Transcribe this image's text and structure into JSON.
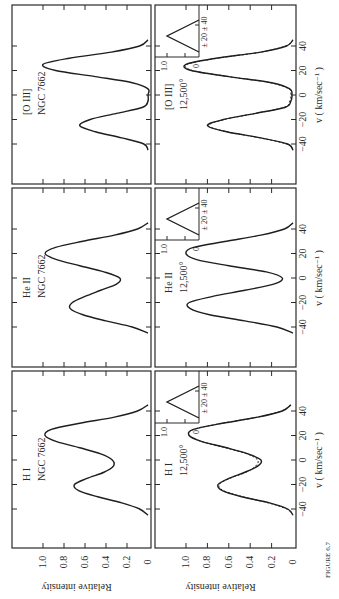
{
  "figure": {
    "caption": "FIGURE 6.7",
    "ylabel": "Relative intensity",
    "xlabel": "v ( km/sec⁻¹ )"
  },
  "chart_data": [
    {
      "type": "line",
      "panel": "top-observed",
      "title": "H I",
      "subtitle": "NGC 7662",
      "xlabel": "",
      "ylabel": "Relative intensity",
      "x": [
        -45,
        -40,
        -35,
        -30,
        -25,
        -20,
        -15,
        -10,
        -5,
        0,
        5,
        10,
        15,
        20,
        25,
        30,
        35,
        40,
        45
      ],
      "series": [
        {
          "name": "observed",
          "values": [
            0.0,
            0.08,
            0.25,
            0.48,
            0.66,
            0.7,
            0.58,
            0.42,
            0.33,
            0.34,
            0.45,
            0.65,
            0.87,
            0.98,
            0.92,
            0.65,
            0.32,
            0.1,
            0.0
          ]
        }
      ],
      "xlim": [
        -45,
        45
      ],
      "ylim": [
        0,
        1.0
      ],
      "yticks": [
        "0",
        "0.2",
        "0.4",
        "0.6",
        "0.8",
        "1.0"
      ]
    },
    {
      "type": "line",
      "panel": "top-observed",
      "title": "He II",
      "subtitle": "NGC 7662",
      "x": [
        -45,
        -40,
        -35,
        -30,
        -25,
        -20,
        -15,
        -10,
        -5,
        0,
        5,
        10,
        15,
        20,
        25,
        30,
        35,
        40,
        45
      ],
      "series": [
        {
          "name": "observed",
          "values": [
            0.0,
            0.15,
            0.4,
            0.62,
            0.74,
            0.72,
            0.6,
            0.45,
            0.3,
            0.27,
            0.42,
            0.65,
            0.87,
            0.98,
            0.88,
            0.62,
            0.32,
            0.1,
            0.0
          ]
        }
      ],
      "xlim": [
        -45,
        45
      ],
      "ylim": [
        0,
        1.0
      ]
    },
    {
      "type": "line",
      "panel": "top-observed",
      "title": "[O III]",
      "subtitle": "NGC 7662",
      "x": [
        -45,
        -40,
        -35,
        -30,
        -25,
        -20,
        -15,
        -10,
        -5,
        0,
        5,
        10,
        15,
        20,
        25,
        30,
        35,
        40,
        45
      ],
      "series": [
        {
          "name": "observed",
          "values": [
            0.0,
            0.04,
            0.25,
            0.5,
            0.65,
            0.55,
            0.3,
            0.05,
            0.0,
            0.0,
            0.0,
            0.15,
            0.5,
            0.88,
            1.0,
            0.75,
            0.35,
            0.08,
            0.0
          ]
        }
      ],
      "xlim": [
        -45,
        45
      ],
      "ylim": [
        0,
        1.0
      ]
    },
    {
      "type": "line",
      "panel": "bottom-model",
      "title": "H I",
      "subtitle": "12,500°",
      "xlabel": "v ( km/sec⁻¹ )",
      "ylabel": "Relative intensity",
      "x": [
        -45,
        -40,
        -35,
        -30,
        -25,
        -20,
        -15,
        -10,
        -5,
        0,
        5,
        10,
        15,
        20,
        25,
        30,
        35,
        40,
        45
      ],
      "series": [
        {
          "name": "model (solid)",
          "values": [
            0.0,
            0.05,
            0.22,
            0.48,
            0.66,
            0.7,
            0.6,
            0.45,
            0.33,
            0.3,
            0.42,
            0.62,
            0.85,
            0.97,
            0.93,
            0.66,
            0.33,
            0.1,
            0.02
          ]
        },
        {
          "name": "observed (dashed)",
          "values": [
            0.0,
            0.06,
            0.23,
            0.47,
            0.65,
            0.69,
            0.59,
            0.44,
            0.35,
            0.33,
            0.43,
            0.63,
            0.85,
            0.97,
            0.93,
            0.66,
            0.33,
            0.11,
            0.02
          ]
        }
      ],
      "xticks": [
        "-40",
        "-20",
        "0",
        "20",
        "40"
      ],
      "yticks": [
        "0",
        "0.2",
        "0.4",
        "0.6",
        "0.8",
        "1.0"
      ],
      "xlim": [
        -45,
        45
      ],
      "ylim": [
        0,
        1.0
      ],
      "inset": {
        "labels": [
          "± 20",
          "± 40"
        ],
        "yticks": [
          "0",
          "1.0"
        ]
      }
    },
    {
      "type": "line",
      "panel": "bottom-model",
      "title": "He II",
      "subtitle": "12,500°",
      "x": [
        -45,
        -40,
        -35,
        -30,
        -25,
        -20,
        -15,
        -10,
        -5,
        0,
        5,
        10,
        15,
        20,
        25,
        30,
        35,
        40,
        45
      ],
      "series": [
        {
          "name": "model",
          "values": [
            0.0,
            0.15,
            0.45,
            0.78,
            0.96,
            0.97,
            0.75,
            0.45,
            0.18,
            0.1,
            0.25,
            0.6,
            0.9,
            1.0,
            0.93,
            0.62,
            0.3,
            0.08,
            0.0
          ]
        }
      ],
      "xticks": [
        "-40",
        "-20",
        "0",
        "20",
        "40"
      ],
      "xlim": [
        -45,
        45
      ],
      "ylim": [
        0,
        1.0
      ],
      "inset": {
        "labels": [
          "± 20",
          "± 40"
        ],
        "yticks": [
          "0",
          "1.0"
        ]
      }
    },
    {
      "type": "line",
      "panel": "bottom-model",
      "title": "[O III]",
      "subtitle": "12,500°",
      "x": [
        -45,
        -40,
        -35,
        -30,
        -25,
        -20,
        -15,
        -10,
        -5,
        0,
        5,
        10,
        15,
        20,
        25,
        30,
        35,
        40,
        45
      ],
      "series": [
        {
          "name": "model (solid)",
          "values": [
            0.0,
            0.05,
            0.3,
            0.62,
            0.8,
            0.65,
            0.35,
            0.07,
            0.02,
            0.01,
            0.03,
            0.2,
            0.6,
            0.95,
            1.0,
            0.72,
            0.3,
            0.06,
            0.0
          ]
        },
        {
          "name": "observed (dashed)",
          "values": [
            0.0,
            0.06,
            0.31,
            0.62,
            0.79,
            0.64,
            0.35,
            0.08,
            0.03,
            0.02,
            0.04,
            0.21,
            0.6,
            0.94,
            0.99,
            0.71,
            0.3,
            0.07,
            0.0
          ]
        }
      ],
      "xticks": [
        "-40",
        "-20",
        "0",
        "20",
        "40"
      ],
      "xlim": [
        -45,
        45
      ],
      "ylim": [
        0,
        1.0
      ],
      "inset": {
        "labels": [
          "± 20",
          "± 40"
        ],
        "yticks": [
          "0",
          "1.0"
        ]
      }
    }
  ]
}
